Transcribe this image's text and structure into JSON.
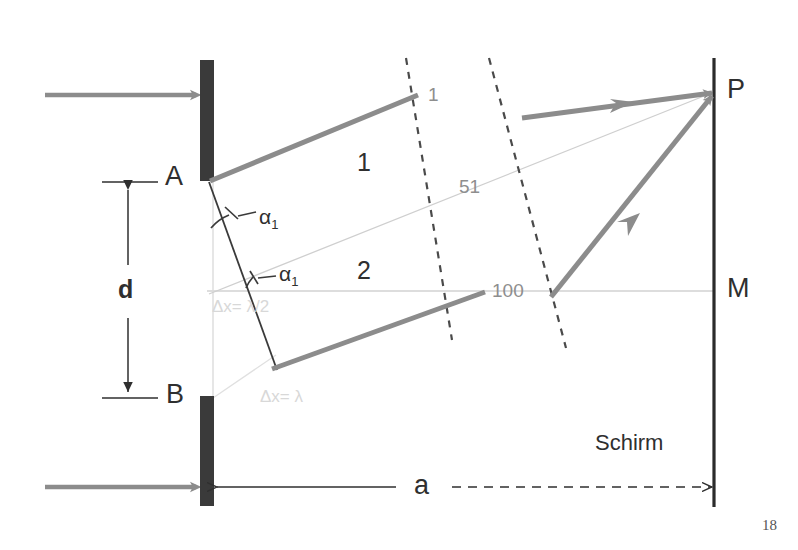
{
  "figure": {
    "page_number": "18",
    "labels": {
      "slit_a": "A",
      "slit_b": "B",
      "point_p": "P",
      "point_m": "M",
      "slit_distance": "d",
      "screen_distance": "a",
      "screen": "Schirm",
      "region_1": "1",
      "region_2": "2",
      "angle_upper": "α",
      "angle_upper_sub": "1",
      "angle_lower": "α",
      "angle_lower_sub": "1",
      "wavefront_1": "1",
      "wavefront_51": "51",
      "wavefront_100": "100",
      "path_diff_upper": "Δx= λ/2",
      "path_diff_lower": "Δx= λ"
    },
    "colors": {
      "barrier": "#3a3a3a",
      "ray": "#8c8c8c",
      "construction_line": "#cfcfcf",
      "dashed_wavefront": "#4a4a4a",
      "screen": "#2b2b2b",
      "text": "#2f2f2f",
      "faint_text": "#d8d8d8",
      "wavefront_text": "#8e8e8e",
      "background": "#ffffff"
    },
    "geometry": {
      "barrier_x": 207,
      "slit_a_y": 180,
      "slit_b_y": 398,
      "screen_x": 714,
      "point_p_y": 92,
      "point_m_y": 291
    }
  }
}
